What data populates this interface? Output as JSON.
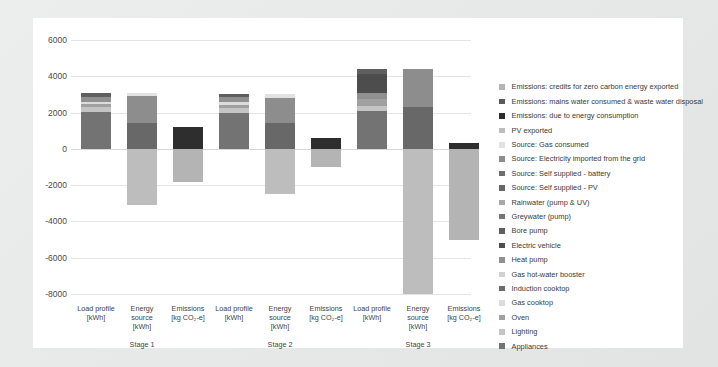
{
  "chart_data": {
    "type": "bar",
    "title": "",
    "subtitle": "",
    "xlabel": "",
    "ylabel": "",
    "ylim": [
      -8000,
      6000
    ],
    "ytick_values": [
      6000,
      4000,
      2000,
      0,
      -2000,
      -4000,
      -6000,
      -8000
    ],
    "ytick_labels": [
      "6000",
      "4000",
      "2000",
      "0",
      "-2000",
      "-4000",
      "-6000",
      "-8000"
    ],
    "grid": true,
    "legend_position": "right",
    "stacked": true,
    "groups": [
      "Stage 1",
      "Stage 2",
      "Stage 3"
    ],
    "columns": [
      "Load profile\n[kWh]",
      "Energy source\n[kWh]",
      "Emissions\n[kg CO₂-e]"
    ],
    "column_labels": [
      {
        "line1": "Load profile",
        "line2": "[kWh]",
        "line3": ""
      },
      {
        "line1": "Energy",
        "line2": "source",
        "line3": "[kWh]"
      },
      {
        "line1": "Emissions",
        "line2": "[kg CO₂-e]",
        "line3": ""
      }
    ],
    "series": [
      {
        "name": "Emissions: credits for zero carbon energy exported",
        "color": "#b4b4b4"
      },
      {
        "name": "Emissions: mains water consumed & waste water disposal",
        "color": "#5a5a5a"
      },
      {
        "name": "Emissions: due to energy consumption",
        "color": "#2e2e2e"
      },
      {
        "name": "PV exported",
        "color": "#bdbdbd"
      },
      {
        "name": "Source: Gas consumed",
        "color": "#e2e2e2"
      },
      {
        "name": "Source: Electricity imported from the grid",
        "color": "#8d8d8d"
      },
      {
        "name": "Source: Self supplied - battery",
        "color": "#6e6e6e"
      },
      {
        "name": "Source: Self supplied - PV",
        "color": "#686868"
      },
      {
        "name": "Rainwater (pump & UV)",
        "color": "#a8a8a8"
      },
      {
        "name": "Greywater (pump)",
        "color": "#767676"
      },
      {
        "name": "Bore pump",
        "color": "#5f5f5f"
      },
      {
        "name": "Electric vehicle",
        "color": "#4d4d4d"
      },
      {
        "name": "Heat pump",
        "color": "#909090"
      },
      {
        "name": "Gas hot-water booster",
        "color": "#d2d2d2"
      },
      {
        "name": "Induction cooktop",
        "color": "#6b6b6b"
      },
      {
        "name": "Gas cooktop",
        "color": "#dcdcdc"
      },
      {
        "name": "Oven",
        "color": "#a0a0a0"
      },
      {
        "name": "Lighting",
        "color": "#c4c4c4"
      },
      {
        "name": "Appliances",
        "color": "#737373"
      }
    ],
    "bars": [
      {
        "group": "Stage 1",
        "column": "Load profile [kWh]",
        "total_positive": 3100,
        "segments": [
          {
            "series": "Appliances",
            "value": 2050,
            "color": "#737373"
          },
          {
            "series": "Lighting",
            "value": 260,
            "color": "#c4c4c4"
          },
          {
            "series": "Oven",
            "value": 160,
            "color": "#a0a0a0"
          },
          {
            "series": "Gas cooktop",
            "value": 120,
            "color": "#dcdcdc"
          },
          {
            "series": "Heat pump",
            "value": 290,
            "color": "#909090"
          },
          {
            "series": "Greywater (pump)",
            "value": 220,
            "color": "#5f5f5f"
          }
        ]
      },
      {
        "group": "Stage 1",
        "column": "Energy source [kWh]",
        "total_positive": 3100,
        "total_negative": -3100,
        "segments": [
          {
            "series": "Source: Self supplied - PV",
            "value": 1450,
            "color": "#686868"
          },
          {
            "series": "Source: Electricity imported from the grid",
            "value": 1450,
            "color": "#8d8d8d"
          },
          {
            "series": "Source: Gas consumed",
            "value": 200,
            "color": "#e2e2e2"
          },
          {
            "series": "PV exported",
            "value": -3100,
            "color": "#bdbdbd"
          }
        ]
      },
      {
        "group": "Stage 1",
        "column": "Emissions [kg CO2-e]",
        "total_positive": 1200,
        "total_negative": -1800,
        "segments": [
          {
            "series": "Emissions: due to energy consumption",
            "value": 1200,
            "color": "#2e2e2e"
          },
          {
            "series": "Emissions: credits for zero carbon energy exported",
            "value": -1800,
            "color": "#b4b4b4"
          }
        ]
      },
      {
        "group": "Stage 2",
        "column": "Load profile [kWh]",
        "total_positive": 3000,
        "segments": [
          {
            "series": "Appliances",
            "value": 2000,
            "color": "#737373"
          },
          {
            "series": "Lighting",
            "value": 250,
            "color": "#c4c4c4"
          },
          {
            "series": "Oven",
            "value": 180,
            "color": "#a0a0a0"
          },
          {
            "series": "Gas cooktop",
            "value": 130,
            "color": "#dcdcdc"
          },
          {
            "series": "Heat pump",
            "value": 280,
            "color": "#909090"
          },
          {
            "series": "Greywater (pump)",
            "value": 160,
            "color": "#5f5f5f"
          }
        ]
      },
      {
        "group": "Stage 2",
        "column": "Energy source [kWh]",
        "total_positive": 3000,
        "total_negative": -2500,
        "segments": [
          {
            "series": "Source: Self supplied - PV",
            "value": 1400,
            "color": "#686868"
          },
          {
            "series": "Source: Electricity imported from the grid",
            "value": 1400,
            "color": "#8d8d8d"
          },
          {
            "series": "Source: Gas consumed",
            "value": 200,
            "color": "#e2e2e2"
          },
          {
            "series": "PV exported",
            "value": -2500,
            "color": "#bdbdbd"
          }
        ]
      },
      {
        "group": "Stage 2",
        "column": "Emissions [kg CO2-e]",
        "total_positive": 600,
        "total_negative": -1000,
        "segments": [
          {
            "series": "Emissions: due to energy consumption",
            "value": 600,
            "color": "#2e2e2e"
          },
          {
            "series": "Emissions: credits for zero carbon energy exported",
            "value": -1000,
            "color": "#b4b4b4"
          }
        ]
      },
      {
        "group": "Stage 3",
        "column": "Load profile [kWh]",
        "total_positive": 4400,
        "segments": [
          {
            "series": "Appliances",
            "value": 2100,
            "color": "#737373"
          },
          {
            "series": "Lighting",
            "value": 250,
            "color": "#c4c4c4"
          },
          {
            "series": "Oven",
            "value": 400,
            "color": "#a0a0a0"
          },
          {
            "series": "Heat pump",
            "value": 350,
            "color": "#909090"
          },
          {
            "series": "Electric vehicle",
            "value": 1000,
            "color": "#4d4d4d"
          },
          {
            "series": "Greywater (pump)",
            "value": 300,
            "color": "#5f5f5f"
          }
        ]
      },
      {
        "group": "Stage 3",
        "column": "Energy source [kWh]",
        "total_positive": 4400,
        "total_negative": -8000,
        "segments": [
          {
            "series": "Source: Self supplied - PV",
            "value": 2300,
            "color": "#686868"
          },
          {
            "series": "Source: Electricity imported from the grid",
            "value": 2100,
            "color": "#8d8d8d"
          },
          {
            "series": "PV exported",
            "value": -8000,
            "color": "#bdbdbd"
          }
        ]
      },
      {
        "group": "Stage 3",
        "column": "Emissions [kg CO2-e]",
        "total_positive": 350,
        "total_negative": -5000,
        "segments": [
          {
            "series": "Emissions: due to energy consumption",
            "value": 350,
            "color": "#2e2e2e"
          },
          {
            "series": "Emissions: credits for zero carbon energy exported",
            "value": -5000,
            "color": "#b4b4b4"
          }
        ]
      }
    ]
  }
}
